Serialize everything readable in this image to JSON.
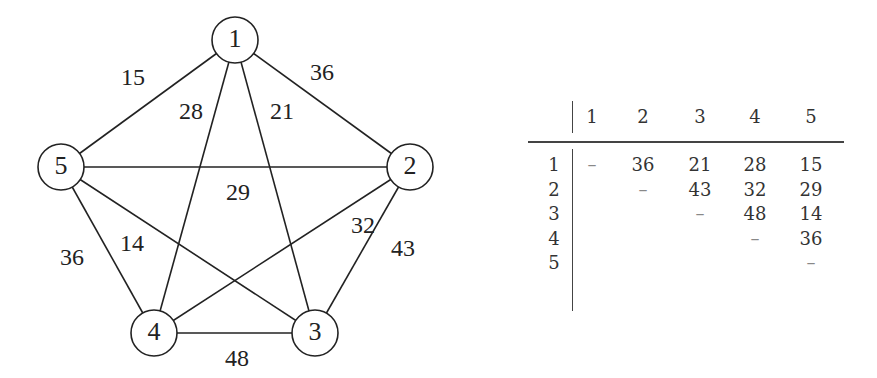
{
  "graph": {
    "nodes": [
      {
        "id": "1",
        "x": 235,
        "y": 40
      },
      {
        "id": "2",
        "x": 410,
        "y": 167
      },
      {
        "id": "3",
        "x": 315,
        "y": 333
      },
      {
        "id": "4",
        "x": 154,
        "y": 333
      },
      {
        "id": "5",
        "x": 61,
        "y": 167
      }
    ],
    "node_radius": 23,
    "edges": [
      {
        "from": "1",
        "to": "5",
        "weight": "15",
        "lx": 133,
        "ly": 79
      },
      {
        "from": "1",
        "to": "2",
        "weight": "36",
        "lx": 322,
        "ly": 74
      },
      {
        "from": "1",
        "to": "4",
        "weight": "28",
        "lx": 191,
        "ly": 113
      },
      {
        "from": "1",
        "to": "3",
        "weight": "21",
        "lx": 282,
        "ly": 113
      },
      {
        "from": "5",
        "to": "2",
        "weight": "29",
        "lx": 238,
        "ly": 194
      },
      {
        "from": "5",
        "to": "4",
        "weight": "36",
        "lx": 72,
        "ly": 259
      },
      {
        "from": "5",
        "to": "3",
        "weight": "14",
        "lx": 132,
        "ly": 245
      },
      {
        "from": "2",
        "to": "4",
        "weight": "32",
        "lx": 363,
        "ly": 227
      },
      {
        "from": "2",
        "to": "3",
        "weight": "43",
        "lx": 403,
        "ly": 250
      },
      {
        "from": "4",
        "to": "3",
        "weight": "48",
        "lx": 237,
        "ly": 360
      }
    ]
  },
  "table": {
    "col_headers": [
      "1",
      "2",
      "3",
      "4",
      "5"
    ],
    "row_headers": [
      "1",
      "2",
      "3",
      "4",
      "5"
    ],
    "rows": [
      [
        "–",
        "36",
        "21",
        "28",
        "15"
      ],
      [
        "",
        "–",
        "43",
        "32",
        "29"
      ],
      [
        "",
        "",
        "–",
        "48",
        "14"
      ],
      [
        "",
        "",
        "",
        "–",
        "36"
      ],
      [
        "",
        "",
        "",
        "",
        "–"
      ]
    ]
  }
}
